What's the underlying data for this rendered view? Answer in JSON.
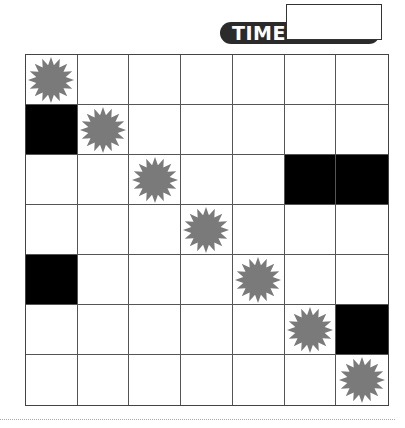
{
  "timer": {
    "label": "TIME",
    "value": ""
  },
  "board": {
    "rows": 7,
    "cols": 7,
    "star_color": "#7a7a7a",
    "black_color": "#000000",
    "cells": [
      [
        "star",
        "empty",
        "empty",
        "empty",
        "empty",
        "empty",
        "empty"
      ],
      [
        "black",
        "star",
        "empty",
        "empty",
        "empty",
        "empty",
        "empty"
      ],
      [
        "empty",
        "empty",
        "star",
        "empty",
        "empty",
        "black",
        "black"
      ],
      [
        "empty",
        "empty",
        "empty",
        "star",
        "empty",
        "empty",
        "empty"
      ],
      [
        "black",
        "empty",
        "empty",
        "empty",
        "star",
        "empty",
        "empty"
      ],
      [
        "empty",
        "empty",
        "empty",
        "empty",
        "empty",
        "star",
        "black"
      ],
      [
        "empty",
        "empty",
        "empty",
        "empty",
        "empty",
        "empty",
        "star"
      ]
    ]
  }
}
